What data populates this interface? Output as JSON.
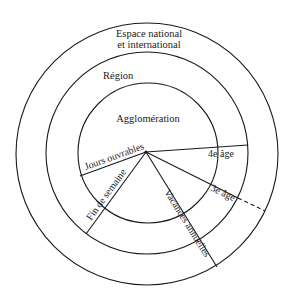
{
  "diagram": {
    "rings": [
      {
        "label": "Espace national",
        "label2": "et international"
      },
      {
        "label": "Région"
      },
      {
        "label": "Agglomération"
      }
    ],
    "segments": {
      "workdays": "Jours ouvrables",
      "weekend": "Fin de semaine",
      "holidays": "Vacances annuelles",
      "fourth_age": "4e âge",
      "third_age": "3e âge"
    },
    "colors": {
      "stroke": "#1a1a1a",
      "background": "#ffffff"
    }
  }
}
